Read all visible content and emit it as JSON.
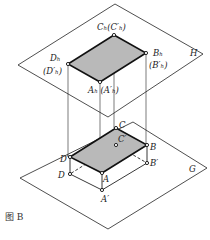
{
  "caption": "图 B",
  "colors": {
    "line": "#222222",
    "shade": "#b9b9b9",
    "background": "#ffffff"
  },
  "planes": {
    "upper": {
      "label": "H"
    },
    "lower": {
      "label": "G"
    }
  },
  "upper_rectangle": {
    "C": "Cₕ(C′ₕ)",
    "B_top": "Bₕ",
    "B_bottom": "(B′ₕ)",
    "D_top": "Dₕ",
    "D_bottom": "(D′ₕ)",
    "A": "Aₕ (A′ₕ)"
  },
  "box": {
    "C": "C",
    "C_prime": "C′",
    "B": "B",
    "B_prime": "B′",
    "A": "A",
    "A_prime": "A′",
    "D_prime": "D′",
    "D": "D"
  }
}
